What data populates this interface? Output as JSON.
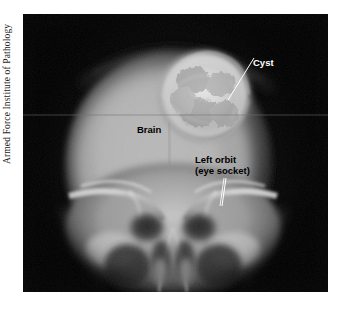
{
  "figure": {
    "kind": "annotated-radiograph",
    "modality": "skull x-ray",
    "view": "frontal (AP) skull radiograph",
    "credit": "Armed Force Institute of Pathology"
  },
  "plate": {
    "background_color": "#050505",
    "page_color": "#ffffff",
    "scanline_seam_color": "#6d6d6d"
  },
  "annotations": [
    {
      "id": "cyst",
      "label": "Cyst",
      "text_color": "#ffffff",
      "leader_color": "#ffffff",
      "style": "light"
    },
    {
      "id": "brain",
      "label": "Brain",
      "text_color": "#000000",
      "leader_color": "none",
      "style": "dark"
    },
    {
      "id": "left-orbit",
      "label_line_1": "Left orbit",
      "label_line_2": "(eye socket)",
      "text_color": "#000000",
      "leader_color": "#ffffff",
      "style": "dark"
    }
  ]
}
